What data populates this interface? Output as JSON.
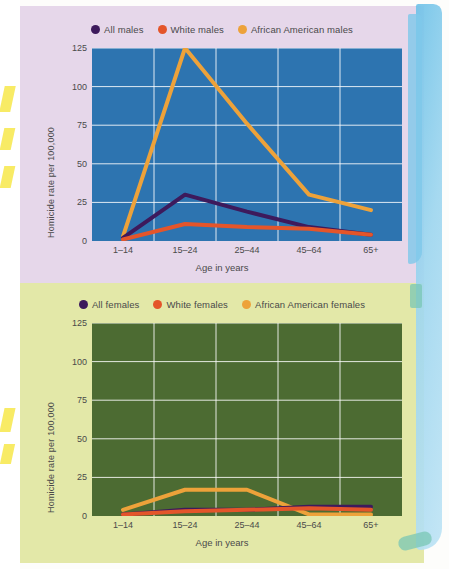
{
  "figure": {
    "panels": [
      "males",
      "females"
    ],
    "axis": {
      "ylabel": "Homicide rate per 100,000",
      "xlabel": "Age in years",
      "yticks": [
        "0",
        "25",
        "50",
        "75",
        "100",
        "125"
      ],
      "xticks": [
        "1–14",
        "15–24",
        "25–44",
        "45–64",
        "65+"
      ]
    },
    "colors": {
      "purple": "#3d1a5c",
      "red": "#e4552a",
      "orange": "#eda23a",
      "plot_bg_males": "#2d74b0",
      "plot_bg_females": "#4c6b32",
      "panel_bg_males": "#e6d7ea",
      "panel_bg_females": "#e3e8a8",
      "grid": "#ffffff"
    }
  },
  "chart_data": [
    {
      "type": "line",
      "title": "",
      "xlabel": "Age in years",
      "ylabel": "Homicide rate per 100,000",
      "categories": [
        "1–14",
        "15–24",
        "25–44",
        "45–64",
        "65+"
      ],
      "ylim": [
        0,
        125
      ],
      "yticks": [
        0,
        25,
        50,
        75,
        100,
        125
      ],
      "grid": true,
      "legend_position": "top",
      "series": [
        {
          "name": "All males",
          "color": "#3d1a5c",
          "values": [
            2,
            30,
            19,
            9,
            4
          ]
        },
        {
          "name": "White males",
          "color": "#e4552a",
          "values": [
            1,
            11,
            9,
            8,
            4
          ]
        },
        {
          "name": "African American males",
          "color": "#eda23a",
          "values": [
            3,
            125,
            76,
            30,
            20
          ]
        }
      ]
    },
    {
      "type": "line",
      "title": "",
      "xlabel": "Age in years",
      "ylabel": "Homicide rate per 100,000",
      "categories": [
        "1–14",
        "15–24",
        "25–44",
        "45–64",
        "65+"
      ],
      "ylim": [
        0,
        125
      ],
      "yticks": [
        0,
        25,
        50,
        75,
        100,
        125
      ],
      "grid": true,
      "legend_position": "top",
      "series": [
        {
          "name": "All females",
          "color": "#3d1a5c",
          "values": [
            1,
            4,
            4,
            6,
            6
          ]
        },
        {
          "name": "White females",
          "color": "#e4552a",
          "values": [
            1,
            3,
            4,
            5,
            4
          ]
        },
        {
          "name": "African American females",
          "color": "#eda23a",
          "values": [
            4,
            17,
            17,
            1,
            1
          ]
        }
      ]
    }
  ],
  "males": {
    "legend": [
      {
        "label": "All males",
        "color": "#3d1a5c"
      },
      {
        "label": "White males",
        "color": "#e4552a"
      },
      {
        "label": "African American males",
        "color": "#eda23a"
      }
    ]
  },
  "females": {
    "legend": [
      {
        "label": "All females",
        "color": "#3d1a5c"
      },
      {
        "label": "White females",
        "color": "#e4552a"
      },
      {
        "label": "African American females",
        "color": "#eda23a"
      }
    ]
  }
}
